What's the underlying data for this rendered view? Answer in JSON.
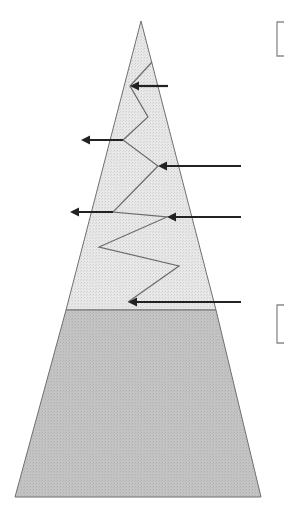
{
  "diagram": {
    "title_cropped": "",
    "colors": {
      "upper_fill": "#e4e4e4",
      "lower_fill": "#c2c2c2",
      "outline": "#6f6f6f",
      "zigzag": "#6a6a6a",
      "arrow": "#222222",
      "bracket": "#8a8a8a",
      "background": "#ffffff"
    },
    "shape": {
      "apex": [
        141,
        21
      ],
      "boundary_y": 310,
      "boundary_left_x": 66,
      "boundary_right_x": 216,
      "base_y": 497,
      "base_left_x": 15,
      "base_right_x": 261
    },
    "zigzag_points": [
      [
        152,
        62
      ],
      [
        130,
        86
      ],
      [
        148,
        117
      ],
      [
        123,
        140
      ],
      [
        158,
        166
      ],
      [
        113,
        212
      ],
      [
        167,
        217
      ],
      [
        99,
        247
      ],
      [
        179,
        266
      ],
      [
        128,
        302
      ]
    ],
    "arrows": [
      {
        "id": "arrow-in-1",
        "direction": "left",
        "from": [
          168,
          86
        ],
        "to": [
          130,
          86
        ]
      },
      {
        "id": "arrow-out-1",
        "direction": "left",
        "from": [
          123,
          140
        ],
        "to": [
          81,
          140
        ]
      },
      {
        "id": "arrow-in-2",
        "direction": "left",
        "from": [
          241,
          166
        ],
        "to": [
          158,
          166
        ]
      },
      {
        "id": "arrow-out-2",
        "direction": "left",
        "from": [
          113,
          212
        ],
        "to": [
          70,
          212
        ]
      },
      {
        "id": "arrow-in-3",
        "direction": "left",
        "from": [
          241,
          217
        ],
        "to": [
          167,
          217
        ]
      },
      {
        "id": "arrow-in-4",
        "direction": "left",
        "from": [
          241,
          302
        ],
        "to": [
          128,
          302
        ]
      }
    ],
    "brackets": [
      {
        "id": "bracket-upper",
        "x": 277,
        "y_top": 22,
        "y_bottom": 56
      },
      {
        "id": "bracket-lower",
        "x": 277,
        "y_top": 305,
        "y_bottom": 343
      }
    ]
  }
}
